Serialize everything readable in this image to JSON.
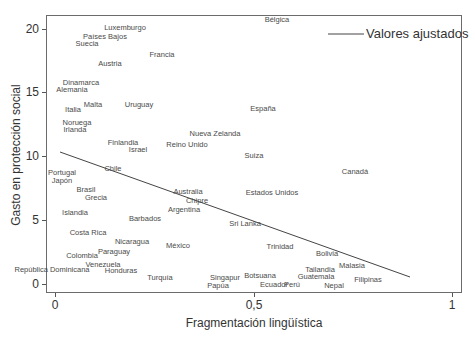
{
  "chart_data": {
    "type": "scatter",
    "title": "",
    "xlabel": "Fragmentación lingüística",
    "ylabel": "Gasto en protección social",
    "xlim": [
      0,
      1
    ],
    "ylim": [
      0,
      20
    ],
    "x_ticks": [
      "0",
      "0,5",
      "1"
    ],
    "y_ticks": [
      "0",
      "5",
      "10",
      "15",
      "20"
    ],
    "grid": false,
    "legend": {
      "position": "top-right",
      "entries": [
        "Valores ajustados"
      ]
    },
    "fitted_line": {
      "x": [
        0.01,
        0.89
      ],
      "y": [
        10.3,
        0.6
      ]
    },
    "points": [
      {
        "label": "Bélgica",
        "x": 0.56,
        "y": 20.8
      },
      {
        "label": "Luxemburgo",
        "x": 0.18,
        "y": 20.1
      },
      {
        "label": "Países Bajos",
        "x": 0.13,
        "y": 19.4
      },
      {
        "label": "Suecia",
        "x": 0.08,
        "y": 18.8
      },
      {
        "label": "Francia",
        "x": 0.27,
        "y": 17.9
      },
      {
        "label": "Austria",
        "x": 0.14,
        "y": 17.2
      },
      {
        "label": "Dinamarca",
        "x": 0.07,
        "y": 15.8
      },
      {
        "label": "Alemania",
        "x": 0.04,
        "y": 15.2
      },
      {
        "label": "Italia",
        "x": 0.04,
        "y": 13.6
      },
      {
        "label": "Malta",
        "x": 0.1,
        "y": 14.0
      },
      {
        "label": "Uruguay",
        "x": 0.21,
        "y": 14.0
      },
      {
        "label": "España",
        "x": 0.52,
        "y": 13.7
      },
      {
        "label": "Noruega",
        "x": 0.06,
        "y": 12.6
      },
      {
        "label": "Irlanda",
        "x": 0.05,
        "y": 12.1
      },
      {
        "label": "Nueva Zelanda",
        "x": 0.4,
        "y": 11.8
      },
      {
        "label": "Finlandia",
        "x": 0.17,
        "y": 11.1
      },
      {
        "label": "Reino Unido",
        "x": 0.33,
        "y": 10.9
      },
      {
        "label": "Israel",
        "x": 0.21,
        "y": 10.5
      },
      {
        "label": "Suiza",
        "x": 0.5,
        "y": 10.0
      },
      {
        "label": "Chile",
        "x": 0.15,
        "y": 9.0
      },
      {
        "label": "Canadá",
        "x": 0.76,
        "y": 8.8
      },
      {
        "label": "Portugal",
        "x": 0.02,
        "y": 8.7
      },
      {
        "label": "Japón",
        "x": 0.02,
        "y": 8.1
      },
      {
        "label": "Brasil",
        "x": 0.08,
        "y": 7.4
      },
      {
        "label": "Australia",
        "x": 0.33,
        "y": 7.3
      },
      {
        "label": "Estados Unidos",
        "x": 0.55,
        "y": 7.2
      },
      {
        "label": "Grecia",
        "x": 0.1,
        "y": 6.8
      },
      {
        "label": "Chipre",
        "x": 0.36,
        "y": 6.5
      },
      {
        "label": "Argentina",
        "x": 0.33,
        "y": 5.8
      },
      {
        "label": "Islandia",
        "x": 0.05,
        "y": 5.6
      },
      {
        "label": "Barbados",
        "x": 0.23,
        "y": 5.1
      },
      {
        "label": "Sri Lanka",
        "x": 0.48,
        "y": 4.7
      },
      {
        "label": "Costa Rica",
        "x": 0.08,
        "y": 4.0
      },
      {
        "label": "Nicaragua",
        "x": 0.19,
        "y": 3.3
      },
      {
        "label": "Trinidad",
        "x": 0.57,
        "y": 2.9
      },
      {
        "label": "Bolivia",
        "x": 0.69,
        "y": 2.4
      },
      {
        "label": "México",
        "x": 0.31,
        "y": 3.0
      },
      {
        "label": "Paraguay",
        "x": 0.15,
        "y": 2.5
      },
      {
        "label": "Colombia",
        "x": 0.07,
        "y": 2.2
      },
      {
        "label": "Malasia",
        "x": 0.75,
        "y": 1.4
      },
      {
        "label": "Tailandia",
        "x": 0.67,
        "y": 1.1
      },
      {
        "label": "Venezuela",
        "x": 0.12,
        "y": 1.5
      },
      {
        "label": "República Dominicana",
        "x": 0.0,
        "y": 1.1
      },
      {
        "label": "Honduras",
        "x": 0.17,
        "y": 1.0
      },
      {
        "label": "Guatemala",
        "x": 0.66,
        "y": 0.5
      },
      {
        "label": "Filipinas",
        "x": 0.79,
        "y": 0.4
      },
      {
        "label": "Turquía",
        "x": 0.26,
        "y": 0.5
      },
      {
        "label": "Singapur",
        "x": 0.43,
        "y": 0.5
      },
      {
        "label": "Botsuana",
        "x": 0.52,
        "y": 0.6
      },
      {
        "label": "Ecuador",
        "x": 0.55,
        "y": -0.1
      },
      {
        "label": "Perú",
        "x": 0.6,
        "y": -0.1
      },
      {
        "label": "Papúa",
        "x": 0.41,
        "y": -0.2
      },
      {
        "label": "Nepal",
        "x": 0.7,
        "y": -0.2
      }
    ]
  },
  "labels": {
    "legend": "Valores ajustados",
    "xlabel": "Fragmentación lingüística",
    "ylabel": "Gasto en protección social",
    "x_ticks": [
      "0",
      "0,5",
      "1"
    ],
    "y_ticks": [
      "0",
      "5",
      "10",
      "15",
      "20"
    ]
  },
  "points_px": [
    {
      "label": "Bélgica",
      "cx": 277,
      "cy": 20
    },
    {
      "label": "Luxemburgo",
      "cx": 125,
      "cy": 28
    },
    {
      "label": "Países Bajos",
      "cx": 105,
      "cy": 37
    },
    {
      "label": "Suecia",
      "cx": 87,
      "cy": 44
    },
    {
      "label": "Francia",
      "cx": 162,
      "cy": 55
    },
    {
      "label": "Austria",
      "cx": 110,
      "cy": 64
    },
    {
      "label": "Dinamarca",
      "cx": 81,
      "cy": 83
    },
    {
      "label": "Alemania",
      "cx": 72,
      "cy": 90
    },
    {
      "label": "Italia",
      "cx": 73,
      "cy": 110
    },
    {
      "label": "Malta",
      "cx": 93,
      "cy": 105
    },
    {
      "label": "Uruguay",
      "cx": 139,
      "cy": 105
    },
    {
      "label": "España",
      "cx": 263,
      "cy": 109
    },
    {
      "label": "Noruega",
      "cx": 77,
      "cy": 123
    },
    {
      "label": "Irlanda",
      "cx": 75,
      "cy": 130
    },
    {
      "label": "Nueva Zelanda",
      "cx": 215,
      "cy": 134
    },
    {
      "label": "Finlandia",
      "cx": 123,
      "cy": 143
    },
    {
      "label": "Reino Unido",
      "cx": 187,
      "cy": 145
    },
    {
      "label": "Israel",
      "cx": 138,
      "cy": 150
    },
    {
      "label": "Suiza",
      "cx": 254,
      "cy": 156
    },
    {
      "label": "Chile",
      "cx": 113,
      "cy": 169
    },
    {
      "label": "Canadá",
      "cx": 355,
      "cy": 172
    },
    {
      "label": "Portugal",
      "cx": 62,
      "cy": 173
    },
    {
      "label": "Japón",
      "cx": 62,
      "cy": 181
    },
    {
      "label": "Brasil",
      "cx": 86,
      "cy": 190
    },
    {
      "label": "Australia",
      "cx": 188,
      "cy": 192
    },
    {
      "label": "Estados Unidos",
      "cx": 272,
      "cy": 193
    },
    {
      "label": "Grecia",
      "cx": 96,
      "cy": 198
    },
    {
      "label": "Chipre",
      "cx": 197,
      "cy": 201
    },
    {
      "label": "Argentina",
      "cx": 184,
      "cy": 210
    },
    {
      "label": "Islandia",
      "cx": 75,
      "cy": 213
    },
    {
      "label": "Barbados",
      "cx": 145,
      "cy": 219
    },
    {
      "label": "Sri Lanka",
      "cx": 245,
      "cy": 224
    },
    {
      "label": "Costa Rica",
      "cx": 88,
      "cy": 233
    },
    {
      "label": "Nicaragua",
      "cx": 132,
      "cy": 242
    },
    {
      "label": "Trinidad",
      "cx": 280,
      "cy": 247
    },
    {
      "label": "Bolivia",
      "cx": 327,
      "cy": 254
    },
    {
      "label": "México",
      "cx": 178,
      "cy": 246
    },
    {
      "label": "Paraguay",
      "cx": 114,
      "cy": 252
    },
    {
      "label": "Colombia",
      "cx": 82,
      "cy": 256
    },
    {
      "label": "Malasia",
      "cx": 352,
      "cy": 266
    },
    {
      "label": "Tailandia",
      "cx": 320,
      "cy": 270
    },
    {
      "label": "Venezuela",
      "cx": 103,
      "cy": 265
    },
    {
      "label": "República Dominicana",
      "cx": 52,
      "cy": 270
    },
    {
      "label": "Honduras",
      "cx": 121,
      "cy": 271
    },
    {
      "label": "Guatemala",
      "cx": 316,
      "cy": 277
    },
    {
      "label": "Filipinas",
      "cx": 368,
      "cy": 280
    },
    {
      "label": "Turquía",
      "cx": 160,
      "cy": 278
    },
    {
      "label": "Singapur",
      "cx": 225,
      "cy": 278
    },
    {
      "label": "Botsuana",
      "cx": 260,
      "cy": 276
    },
    {
      "label": "Ecuador",
      "cx": 274,
      "cy": 285
    },
    {
      "label": "Perú",
      "cx": 292,
      "cy": 285
    },
    {
      "label": "Papúa",
      "cx": 218,
      "cy": 286
    },
    {
      "label": "Nepal",
      "cx": 334,
      "cy": 286
    }
  ]
}
